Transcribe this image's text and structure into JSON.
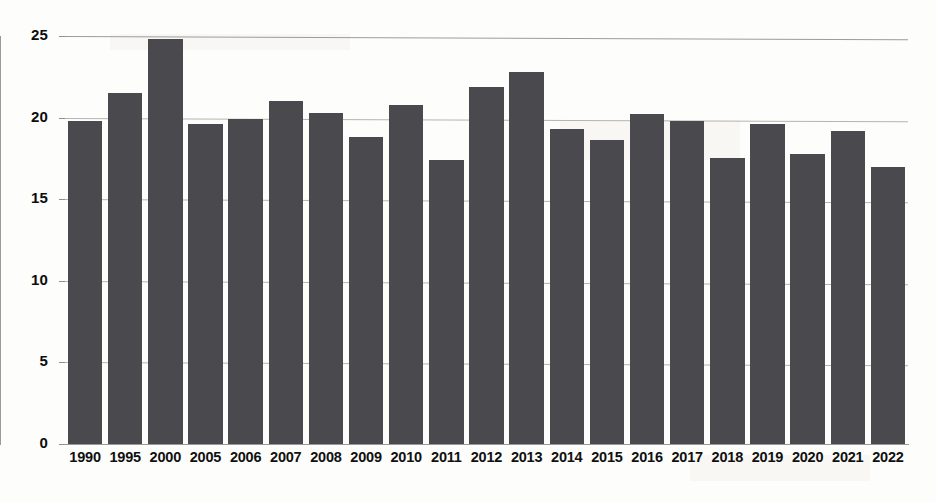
{
  "chart_data": {
    "type": "bar",
    "title": "",
    "subtitle": "",
    "xlabel": "",
    "ylabel": "",
    "categories": [
      "1990",
      "1995",
      "2000",
      "2005",
      "2006",
      "2007",
      "2008",
      "2009",
      "2010",
      "2011",
      "2012",
      "2013",
      "2014",
      "2015",
      "2016",
      "2017",
      "2018",
      "2019",
      "2020",
      "2021",
      "2022"
    ],
    "values": [
      19.8,
      21.5,
      24.8,
      19.6,
      19.9,
      21.0,
      20.3,
      18.8,
      20.8,
      17.4,
      21.9,
      22.8,
      19.3,
      18.6,
      20.2,
      19.8,
      17.5,
      19.6,
      17.8,
      19.2,
      17.0
    ],
    "ylim": [
      0,
      25
    ],
    "ytick_labels": [
      "0",
      "5",
      "10",
      "15",
      "20",
      "25"
    ],
    "ytick_values": [
      0,
      5,
      10,
      15,
      20,
      25
    ],
    "grid": "horizontal",
    "legend": "none",
    "bar_color": "#4a4a4e",
    "gridline_color": "#b4b4b4",
    "axis_color": "#9a9a9a",
    "background_color": "#fdfdfb",
    "annotations": []
  }
}
